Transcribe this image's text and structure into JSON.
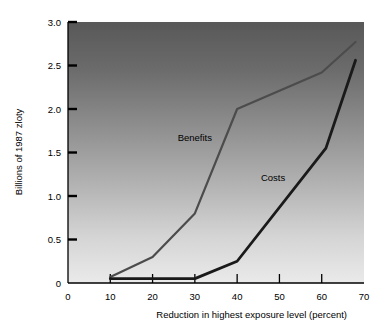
{
  "chart_data": {
    "type": "line",
    "title": "",
    "xlabel": "Reduction in highest exposure level (percent)",
    "ylabel": "Billions of 1987 zloty",
    "xlim": [
      0,
      70
    ],
    "ylim": [
      0,
      3.0
    ],
    "xticks": [
      "0",
      "10",
      "20",
      "30",
      "40",
      "50",
      "60",
      "70"
    ],
    "xtick_values": [
      0,
      10,
      20,
      30,
      40,
      50,
      60,
      70
    ],
    "yticks": [
      "0",
      "0.5",
      "1.0",
      "1.5",
      "2.0",
      "2.5",
      "3.0"
    ],
    "ytick_values": [
      0,
      0.5,
      1.0,
      1.5,
      2.0,
      2.5,
      3.0
    ],
    "grid": false,
    "legend_position": "inline-annotations",
    "background": "vertical-gradient-dark-to-light",
    "background_top_color": "#585858",
    "background_bottom_color": "#eaeaea",
    "series": [
      {
        "name": "Benefits",
        "color": "#4c4c4c",
        "line_width": 2.2,
        "x": [
          10,
          20,
          30,
          40,
          60,
          68
        ],
        "values": [
          0.07,
          0.3,
          0.8,
          2.0,
          2.42,
          2.77
        ],
        "label_x": 30,
        "label_y": 1.63
      },
      {
        "name": "Costs",
        "color": "#1a1a1a",
        "line_width": 2.8,
        "x": [
          10,
          20,
          30,
          40,
          61,
          68
        ],
        "values": [
          0.05,
          0.05,
          0.05,
          0.25,
          1.55,
          2.56
        ],
        "label_x": 48.5,
        "label_y": 1.17
      }
    ]
  }
}
